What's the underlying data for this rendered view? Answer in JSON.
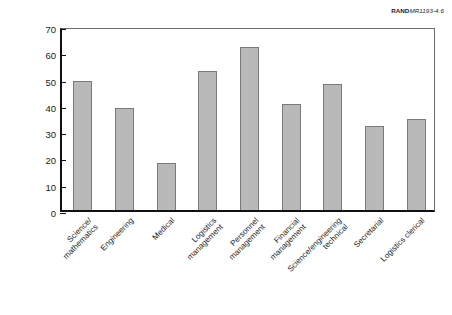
{
  "credit": {
    "brand": "RAND",
    "document_id": "MR1193-4.6"
  },
  "chart_data": {
    "type": "bar",
    "title": "",
    "xlabel": "",
    "ylabel": "Increase (percent)",
    "ylim": [
      0,
      70
    ],
    "ytick_step": 10,
    "yticks": [
      "0",
      "10",
      "20",
      "30",
      "40",
      "50",
      "60",
      "70"
    ],
    "grid": false,
    "legend": "none",
    "bar_color": "#b9b9b9",
    "bar_edge_color": "#7a7a7a",
    "axis_color": "#111111",
    "categories": [
      "Science/\nmathematics",
      "Engineering",
      "Medical",
      "Logistics\nmanagement",
      "Personnel\nmanagement",
      "Financial\nmanagement",
      "Science/engineering\ntechnical",
      "Secretarial",
      "Logistics clerical"
    ],
    "category_lines": [
      [
        "Science/",
        "mathematics"
      ],
      [
        "Engineering"
      ],
      [
        "Medical"
      ],
      [
        "Logistics",
        "management"
      ],
      [
        "Personnel",
        "management"
      ],
      [
        "Financial",
        "management"
      ],
      [
        "Science/engineering",
        "technical"
      ],
      [
        "Secretarial"
      ],
      [
        "Logistics clerical"
      ]
    ],
    "values": [
      49,
      39,
      18,
      53,
      62,
      40.5,
      48,
      32,
      34.5
    ]
  }
}
